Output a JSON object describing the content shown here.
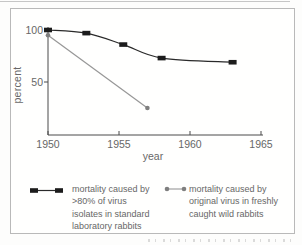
{
  "chart_data": {
    "type": "line",
    "title": "",
    "xlabel": "year",
    "ylabel": "percent",
    "xlim": [
      1950,
      1965
    ],
    "ylim": [
      0,
      100
    ],
    "x_ticks": [
      1950,
      1955,
      1960,
      1965
    ],
    "y_ticks": [
      100,
      50
    ],
    "grid": false,
    "legend_position": "bottom",
    "axis_color": "#4a4a4a",
    "series": [
      {
        "name": "mortality caused by >80% of virus isolates in standard laboratory rabbits",
        "marker": "square",
        "color": "#1c1c1c",
        "line_color": "#2a2a2a",
        "points": [
          [
            1950,
            100
          ],
          [
            1952.7,
            97
          ],
          [
            1955.3,
            86
          ],
          [
            1958,
            73
          ],
          [
            1963,
            69
          ]
        ]
      },
      {
        "name": "mortality caused by original virus in freshly caught wild rabbits",
        "marker": "circle",
        "color": "#7f7f7f",
        "line_color": "#979797",
        "points": [
          [
            1950,
            95
          ],
          [
            1957,
            25
          ]
        ]
      }
    ]
  },
  "legend": {
    "items": [
      {
        "lines": [
          "mortality caused by",
          ">80% of virus",
          "isolates in standard",
          "laboratory rabbits"
        ]
      },
      {
        "lines": [
          "mortality caused by",
          "original virus in freshly",
          "caught wild rabbits"
        ]
      }
    ]
  }
}
